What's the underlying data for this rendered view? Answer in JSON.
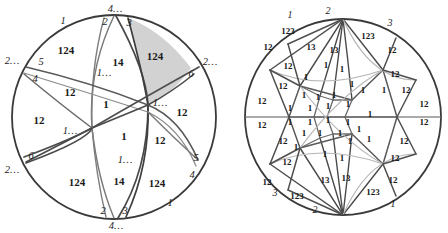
{
  "figure": {
    "type": "two-circle-tessellation-diagram",
    "background_color": "#ffffff",
    "stroke_dark": "#3a3a3a",
    "stroke_mid": "#6f6f6f",
    "stroke_light": "#a9a9a9",
    "shaded_region_color": "#d0d0d0",
    "label_color": "#1a1a1a"
  },
  "left_circle": {
    "name": "coarse-tessellation-disk",
    "center": {
      "x": 114,
      "y": 117
    },
    "radius": 102,
    "shaded_region_label": "124",
    "region_labels": [
      {
        "text": "124",
        "x": 66,
        "y": 50
      },
      {
        "text": "14",
        "x": 118,
        "y": 62
      },
      {
        "text": "124",
        "x": 155,
        "y": 56
      },
      {
        "text": "12",
        "x": 70,
        "y": 92
      },
      {
        "text": "12",
        "x": 39,
        "y": 120
      },
      {
        "text": "1",
        "x": 106,
        "y": 104
      },
      {
        "text": "12",
        "x": 182,
        "y": 112
      },
      {
        "text": "1",
        "x": 124,
        "y": 136
      },
      {
        "text": "12",
        "x": 160,
        "y": 140
      },
      {
        "text": "124",
        "x": 77,
        "y": 182
      },
      {
        "text": "14",
        "x": 119,
        "y": 181
      },
      {
        "text": "124",
        "x": 157,
        "y": 183
      }
    ],
    "boundary_labels": [
      {
        "text": "4…",
        "x": 115,
        "y": 9
      },
      {
        "text": "2",
        "x": 105,
        "y": 22
      },
      {
        "text": "3",
        "x": 129,
        "y": 23
      },
      {
        "text": "1",
        "x": 63,
        "y": 21
      },
      {
        "text": "2…",
        "x": 12,
        "y": 61
      },
      {
        "text": "5",
        "x": 41,
        "y": 62
      },
      {
        "text": "4",
        "x": 35,
        "y": 79
      },
      {
        "text": "2…",
        "x": 210,
        "y": 62
      },
      {
        "text": "6",
        "x": 191,
        "y": 74
      },
      {
        "text": "1…",
        "x": 104,
        "y": 73
      },
      {
        "text": "1…",
        "x": 160,
        "y": 103
      },
      {
        "text": "1…",
        "x": 70,
        "y": 131
      },
      {
        "text": "1…",
        "x": 125,
        "y": 160
      },
      {
        "text": "2…",
        "x": 12,
        "y": 170
      },
      {
        "text": "6",
        "x": 31,
        "y": 156
      },
      {
        "text": "5",
        "x": 196,
        "y": 158
      },
      {
        "text": "4",
        "x": 192,
        "y": 175
      },
      {
        "text": "1",
        "x": 170,
        "y": 203
      },
      {
        "text": "2",
        "x": 103,
        "y": 211
      },
      {
        "text": "3",
        "x": 125,
        "y": 211
      },
      {
        "text": "4…",
        "x": 116,
        "y": 226
      }
    ]
  },
  "right_circle": {
    "name": "fine-triangulation-disk",
    "center": {
      "x": 343,
      "y": 117
    },
    "radius": 98,
    "region_labels": [
      {
        "text": "123",
        "x": 288,
        "y": 31
      },
      {
        "text": "12",
        "x": 268,
        "y": 47
      },
      {
        "text": "13",
        "x": 311,
        "y": 47
      },
      {
        "text": "13",
        "x": 334,
        "y": 50
      },
      {
        "text": "123",
        "x": 368,
        "y": 36
      },
      {
        "text": "12",
        "x": 392,
        "y": 50
      },
      {
        "text": "12",
        "x": 288,
        "y": 66
      },
      {
        "text": "1",
        "x": 326,
        "y": 65
      },
      {
        "text": "1",
        "x": 342,
        "y": 69
      },
      {
        "text": "12",
        "x": 395,
        "y": 74
      },
      {
        "text": "12",
        "x": 283,
        "y": 86
      },
      {
        "text": "1",
        "x": 306,
        "y": 77
      },
      {
        "text": "1",
        "x": 352,
        "y": 84
      },
      {
        "text": "1",
        "x": 363,
        "y": 90
      },
      {
        "text": "1",
        "x": 384,
        "y": 90
      },
      {
        "text": "12",
        "x": 406,
        "y": 90
      },
      {
        "text": "1",
        "x": 304,
        "y": 95
      },
      {
        "text": "1",
        "x": 318,
        "y": 97
      },
      {
        "text": "1",
        "x": 334,
        "y": 95
      },
      {
        "text": "12",
        "x": 262,
        "y": 101
      },
      {
        "text": "1",
        "x": 290,
        "y": 108
      },
      {
        "text": "1",
        "x": 310,
        "y": 108
      },
      {
        "text": "1",
        "x": 328,
        "y": 106
      },
      {
        "text": "1",
        "x": 348,
        "y": 104
      },
      {
        "text": "12",
        "x": 424,
        "y": 104
      },
      {
        "text": "12",
        "x": 262,
        "y": 125
      },
      {
        "text": "1",
        "x": 290,
        "y": 122
      },
      {
        "text": "1",
        "x": 310,
        "y": 122
      },
      {
        "text": "1",
        "x": 328,
        "y": 120
      },
      {
        "text": "1",
        "x": 348,
        "y": 122
      },
      {
        "text": "1",
        "x": 370,
        "y": 114
      },
      {
        "text": "12",
        "x": 424,
        "y": 122
      },
      {
        "text": "1",
        "x": 304,
        "y": 133
      },
      {
        "text": "1",
        "x": 320,
        "y": 133
      },
      {
        "text": "1",
        "x": 340,
        "y": 133
      },
      {
        "text": "1",
        "x": 359,
        "y": 129
      },
      {
        "text": "12",
        "x": 283,
        "y": 141
      },
      {
        "text": "1",
        "x": 296,
        "y": 147
      },
      {
        "text": "1",
        "x": 350,
        "y": 141
      },
      {
        "text": "1",
        "x": 369,
        "y": 139
      },
      {
        "text": "12",
        "x": 404,
        "y": 141
      },
      {
        "text": "12",
        "x": 287,
        "y": 162
      },
      {
        "text": "1",
        "x": 325,
        "y": 154
      },
      {
        "text": "1",
        "x": 342,
        "y": 158
      },
      {
        "text": "12",
        "x": 395,
        "y": 158
      },
      {
        "text": "12",
        "x": 267,
        "y": 182
      },
      {
        "text": "13",
        "x": 325,
        "y": 180
      },
      {
        "text": "13",
        "x": 346,
        "y": 178
      },
      {
        "text": "12",
        "x": 393,
        "y": 180
      },
      {
        "text": "123",
        "x": 297,
        "y": 196
      },
      {
        "text": "123",
        "x": 373,
        "y": 192
      }
    ],
    "boundary_labels": [
      {
        "text": "1",
        "x": 290,
        "y": 15
      },
      {
        "text": "2",
        "x": 328,
        "y": 11
      },
      {
        "text": "3",
        "x": 390,
        "y": 23
      },
      {
        "text": "3",
        "x": 275,
        "y": 193
      },
      {
        "text": "2",
        "x": 315,
        "y": 210
      },
      {
        "text": "1",
        "x": 393,
        "y": 204
      }
    ]
  }
}
